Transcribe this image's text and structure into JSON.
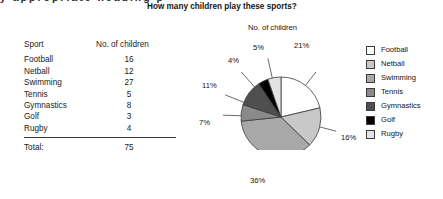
{
  "page": {
    "cutoff_text": "y appropriate heading p"
  },
  "chart": {
    "title": "How many children play these sports?",
    "pie_subtitle": "No. of children"
  },
  "table": {
    "headers": [
      "Sport",
      "No. of children"
    ],
    "rows": [
      {
        "sport": "Football",
        "count": "16"
      },
      {
        "sport": "Netball",
        "count": "12"
      },
      {
        "sport": "Swimming",
        "count": "27"
      },
      {
        "sport": "Tennis",
        "count": "5"
      },
      {
        "sport": "Gymnastics",
        "count": "8"
      },
      {
        "sport": "Golf",
        "count": "3"
      },
      {
        "sport": "Rugby",
        "count": "4"
      }
    ],
    "total_label": "Total:",
    "total_value": "75"
  },
  "legend": {
    "items": [
      {
        "label": "Football",
        "color": "#ffffff"
      },
      {
        "label": "Netball",
        "color": "#c8c8c8"
      },
      {
        "label": "Swimming",
        "color": "#a8a8a8"
      },
      {
        "label": "Tennis",
        "color": "#8a8a8a"
      },
      {
        "label": "Gymnastics",
        "color": "#4f4f4f"
      },
      {
        "label": "Golf",
        "color": "#000000"
      },
      {
        "label": "Rugby",
        "color": "#e3e3e3"
      }
    ]
  },
  "pie_labels": [
    {
      "text": "21%",
      "x": 294,
      "y": 46
    },
    {
      "text": "16%",
      "x": 342,
      "y": 136
    },
    {
      "text": "36%",
      "x": 252,
      "y": 178
    },
    {
      "text": "7%",
      "x": 200,
      "y": 121
    },
    {
      "text": "11%",
      "x": 204,
      "y": 84
    },
    {
      "text": "4%",
      "x": 228,
      "y": 57
    },
    {
      "text": "5%",
      "x": 253,
      "y": 45
    }
  ],
  "chart_data": {
    "type": "pie",
    "title": "How many children play these sports?",
    "ylabel": "No. of children",
    "categories": [
      "Football",
      "Netball",
      "Swimming",
      "Tennis",
      "Gymnastics",
      "Golf",
      "Rugby"
    ],
    "values": [
      16,
      12,
      27,
      5,
      8,
      3,
      4
    ],
    "percentages": [
      21,
      16,
      36,
      7,
      11,
      4,
      5
    ],
    "percent_labels": [
      "21%",
      "16%",
      "36%",
      "7%",
      "11%",
      "4%",
      "5%"
    ],
    "total": 75,
    "colors": [
      "#ffffff",
      "#c8c8c8",
      "#a8a8a8",
      "#8a8a8a",
      "#4f4f4f",
      "#000000",
      "#e3e3e3"
    ],
    "start_angle_deg": 0,
    "direction": "clockwise",
    "legend_position": "right",
    "grid": false
  }
}
